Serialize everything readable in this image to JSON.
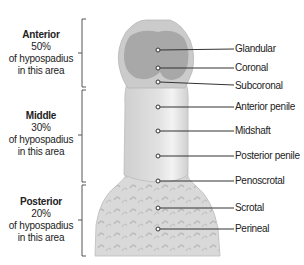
{
  "regions": [
    {
      "name": "Anterior",
      "percent": "50%",
      "line1": "of hypospadius",
      "line2": "in this area"
    },
    {
      "name": "Middle",
      "percent": "30%",
      "line1": "of hypospadius",
      "line2": "in this area"
    },
    {
      "name": "Posterior",
      "percent": "20%",
      "line1": "of hypospadius",
      "line2": "in this area"
    }
  ],
  "sites": [
    {
      "label": "Glandular",
      "y": 49
    },
    {
      "label": "Coronal",
      "y": 68
    },
    {
      "label": "Subcoronal",
      "y": 84
    },
    {
      "label": "Anterior penile",
      "y": 108
    },
    {
      "label": "Midshaft",
      "y": 132
    },
    {
      "label": "Posterior penile",
      "y": 156
    },
    {
      "label": "Penoscrotal",
      "y": 182
    },
    {
      "label": "Scrotal",
      "y": 208
    },
    {
      "label": "Perineal",
      "y": 230
    }
  ],
  "colors": {
    "glans_dark": "#a9a9a9",
    "glans_outer": "#c9c9c9",
    "shaft": "#dcdcdc",
    "shaft_highlight": "#efefef",
    "scrotum": "#d6d6d6",
    "line": "#333333",
    "bracket": "#555555"
  }
}
